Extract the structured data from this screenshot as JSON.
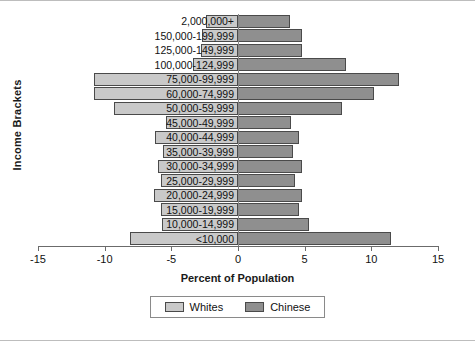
{
  "chart_data": {
    "type": "bar",
    "subtype": "population-pyramid",
    "title": "",
    "xlabel": "Percent of Population",
    "ylabel": "Income Brackets",
    "xlim": [
      -15,
      15
    ],
    "xticks": [
      -15,
      -10,
      -5,
      0,
      5,
      10,
      15
    ],
    "xtick_labels": [
      "-15",
      "-10",
      "-5",
      "0",
      "5",
      "10",
      "15"
    ],
    "grid": false,
    "legend_position": "bottom",
    "categories": [
      "2,000,000+",
      "150,000-199,999",
      "125,000-149,999",
      "100,000-124,999",
      "75,000-99,999",
      "60,000-74,999",
      "50,000-59,999",
      "45,000-49,999",
      "40,000-44,999",
      "35,000-39,999",
      "30,000-34,999",
      "25,000-29,999",
      "20,000-24,999",
      "15,000-19,999",
      "10,000-14,999",
      "<10,000"
    ],
    "series": [
      {
        "name": "Whites",
        "color": "#c9c9c9",
        "side": "left",
        "values": [
          2.4,
          2.7,
          2.8,
          3.4,
          10.8,
          10.8,
          9.3,
          5.4,
          6.2,
          5.6,
          6.0,
          5.8,
          6.3,
          5.8,
          5.7,
          8.1
        ]
      },
      {
        "name": "Chinese",
        "color": "#8f8f8f",
        "side": "right",
        "values": [
          3.9,
          4.8,
          4.8,
          8.1,
          12.1,
          10.2,
          7.8,
          4.0,
          4.6,
          4.1,
          4.8,
          4.3,
          4.8,
          4.6,
          5.3,
          11.5
        ]
      }
    ]
  },
  "legend": {
    "items": [
      {
        "label": "Whites",
        "color": "#c9c9c9"
      },
      {
        "label": "Chinese",
        "color": "#8f8f8f"
      }
    ]
  }
}
